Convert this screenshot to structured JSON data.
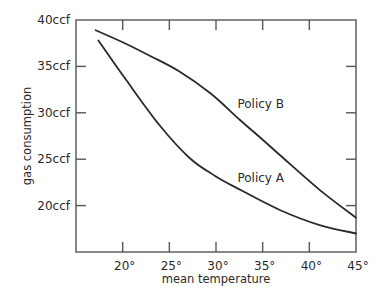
{
  "chart_data": {
    "type": "line",
    "title": "",
    "xlabel": "mean temperature",
    "ylabel": "gas consumption",
    "xlim": [
      15,
      45
    ],
    "ylim": [
      15,
      40
    ],
    "grid": false,
    "legend": "inline labels",
    "x_ticks": [
      20,
      25,
      30,
      35,
      40,
      45
    ],
    "x_tick_labels": [
      "20°",
      "25°",
      "30°",
      "35°",
      "40°",
      "45°"
    ],
    "y_ticks": [
      20,
      25,
      30,
      35,
      40
    ],
    "y_tick_labels": [
      "20ccf",
      "25ccf",
      "30ccf",
      "35ccf",
      "40ccf"
    ],
    "series": [
      {
        "name": "Policy B",
        "label": "Policy B",
        "label_pos": [
          32.3,
          30.9
        ],
        "x": [
          17.1,
          20.0,
          23.0,
          26.0,
          29.4,
          32.6,
          35.0,
          36.9,
          41.1,
          45.0
        ],
        "y": [
          38.9,
          37.6,
          36.1,
          34.5,
          32.1,
          29.2,
          27.1,
          25.4,
          21.7,
          18.7
        ]
      },
      {
        "name": "Policy A",
        "label": "Policy A",
        "label_pos": [
          32.3,
          23.0
        ],
        "x": [
          17.4,
          20.4,
          24.0,
          27.2,
          29.9,
          32.6,
          36.9,
          41.1,
          45.0
        ],
        "y": [
          37.8,
          33.5,
          28.6,
          25.1,
          23.2,
          21.7,
          19.5,
          17.9,
          17.0
        ]
      }
    ],
    "colors": {
      "line": "#2a2a2a",
      "axis": "#555555",
      "background": "#ffffff"
    }
  }
}
